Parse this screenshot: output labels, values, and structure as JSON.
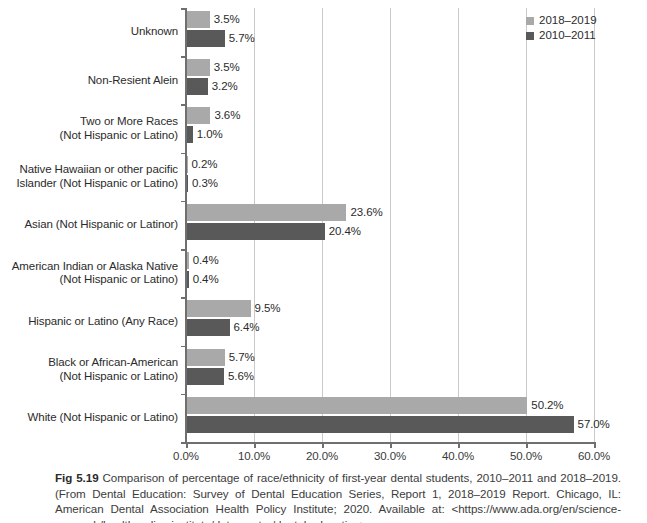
{
  "figure": {
    "number": "Fig 5.19",
    "caption_text": " Comparison of percentage of race/ethnicity of first-year dental students, 2010–2011 and 2018–2019. (From Dental Education: Survey of Dental Education Series, Report 1, 2018–2019 Report. Chicago, IL: American Dental Association Health Policy Institute; 2020. Available at: <https://www.ada.org/en/science-research/health-policy-institute/data-center/dental-education>;"
  },
  "chart_data": {
    "type": "bar",
    "orientation": "horizontal",
    "title": "",
    "xlabel": "",
    "ylabel": "",
    "xlim": [
      0,
      60
    ],
    "xticks": [
      0,
      10,
      20,
      30,
      40,
      50,
      60
    ],
    "xtick_labels": [
      "0.0%",
      "10.0%",
      "20.0%",
      "30.0%",
      "40.0%",
      "50.0%",
      "60.0%"
    ],
    "grid": true,
    "legend_position": "top-right",
    "categories": [
      "Unknown",
      "Non-Resient Alein",
      "Two or More Races\n(Not Hispanic or Latino)",
      "Native Hawaiian or other pacific\nIslander (Not Hispanic or Latino)",
      "Asian (Not Hispanic or Latinor)",
      "American Indian or Alaska Native\n(Not Hispanic or Latino)",
      "Hispanic or Latino (Any Race)",
      "Black or African-American\n(Not Hispanic or Latino)",
      "White (Not Hispanic or Latino)"
    ],
    "category_lines": [
      [
        "Unknown"
      ],
      [
        "Non-Resient Alein"
      ],
      [
        "Two or More Races",
        "(Not Hispanic or Latino)"
      ],
      [
        "Native Hawaiian or other pacific",
        "Islander (Not Hispanic or Latino)"
      ],
      [
        "Asian (Not Hispanic or Latinor)"
      ],
      [
        "American Indian or Alaska Native",
        "(Not Hispanic or Latino)"
      ],
      [
        "Hispanic or Latino (Any Race)"
      ],
      [
        "Black or African-American",
        "(Not Hispanic or Latino)"
      ],
      [
        "White (Not Hispanic or Latino)"
      ]
    ],
    "series": [
      {
        "name": "2018–2019",
        "color": "#a9a9a9",
        "values": [
          3.5,
          3.5,
          3.6,
          0.2,
          23.6,
          0.4,
          9.5,
          5.7,
          50.2
        ],
        "labels": [
          "3.5%",
          "3.5%",
          "3.6%",
          "0.2%",
          "23.6%",
          "0.4%",
          "9.5%",
          "5.7%",
          "50.2%"
        ]
      },
      {
        "name": "2010–2011",
        "color": "#595959",
        "values": [
          5.7,
          3.2,
          1.0,
          0.3,
          20.4,
          0.4,
          6.4,
          5.6,
          57.0
        ],
        "labels": [
          "5.7%",
          "3.2%",
          "1.0%",
          "0.3%",
          "20.4%",
          "0.4%",
          "6.4%",
          "5.6%",
          "57.0%"
        ]
      }
    ]
  },
  "legend": {
    "items": [
      {
        "label": "2018–2019",
        "color": "#a9a9a9"
      },
      {
        "label": "2010–2011",
        "color": "#595959"
      }
    ]
  }
}
